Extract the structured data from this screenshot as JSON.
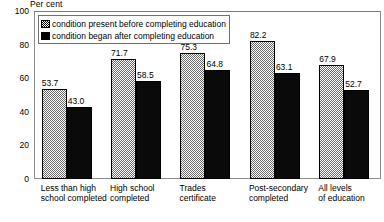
{
  "chart_data": {
    "type": "bar",
    "title": "",
    "subtitle": "",
    "xlabel": "",
    "ylabel": "Per cent",
    "unit_caption": "Per cent",
    "ylim": [
      0,
      100
    ],
    "grid": false,
    "legend_position": "top-left",
    "yticks": [
      "0",
      "20",
      "40",
      "60",
      "80",
      "100"
    ],
    "ytick_values": [
      0,
      20,
      40,
      60,
      80,
      100
    ],
    "categories": [
      "Less than high\nschool completed",
      "High school\ncompleted",
      "Trades\ncertificate",
      "Post-secondary\ncompleted",
      "All levels\nof education"
    ],
    "series": [
      {
        "name": "condition present before completing education",
        "swatch": "pattern",
        "values": [
          53.7,
          71.7,
          75.3,
          82.2,
          67.9
        ],
        "labels": [
          "53.7",
          "71.7",
          "75.3",
          "82.2",
          "67.9"
        ]
      },
      {
        "name": "condition began after completing education",
        "swatch": "solid",
        "values": [
          43.0,
          58.5,
          64.8,
          63.1,
          52.7
        ],
        "labels": [
          "43.0",
          "58.5",
          "64.8",
          "63.1",
          "52.7"
        ]
      }
    ],
    "colors": {
      "pattern_fill": "#6b6b6b",
      "solid_fill": "#0a0a0a",
      "frame": "#8d8d8d",
      "background": "#ffffff",
      "text": "#000000"
    }
  }
}
